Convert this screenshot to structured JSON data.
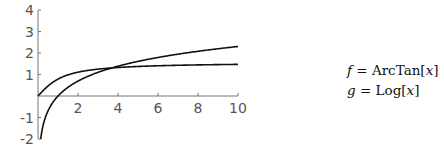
{
  "chart_data": {
    "type": "line",
    "title": "",
    "xlabel": "",
    "ylabel": "",
    "xlim": [
      0,
      10
    ],
    "ylim": [
      -2,
      4
    ],
    "grid": false,
    "x_ticks": [
      2,
      4,
      6,
      8,
      10
    ],
    "y_ticks": [
      -2,
      -1,
      1,
      2,
      3,
      4
    ],
    "series": [
      {
        "name": "f = ArcTan[x]",
        "function": "ArcTan[x]",
        "x": [
          0,
          1,
          2,
          3,
          4,
          5,
          6,
          7,
          8,
          9,
          10
        ],
        "values": [
          0,
          0.785,
          1.107,
          1.249,
          1.326,
          1.373,
          1.406,
          1.429,
          1.446,
          1.46,
          1.471
        ]
      },
      {
        "name": "g = Log[x]",
        "function": "Log[x]",
        "x": [
          0.135,
          1,
          2,
          3,
          4,
          5,
          6,
          7,
          8,
          9,
          10
        ],
        "values": [
          -2,
          0,
          0.693,
          1.099,
          1.386,
          1.609,
          1.792,
          1.946,
          2.079,
          2.197,
          2.303
        ]
      }
    ],
    "legend": {
      "position": "right",
      "entries": [
        "f = ArcTan[x]",
        "g = Log[x]"
      ]
    }
  },
  "legend": {
    "f": {
      "var": "f",
      "eq": " = ",
      "expr": "ArcTan[",
      "arg": "x",
      "close": "]"
    },
    "g": {
      "var": "g",
      "eq": " = ",
      "expr": "Log[",
      "arg": "x",
      "close": "]"
    }
  }
}
